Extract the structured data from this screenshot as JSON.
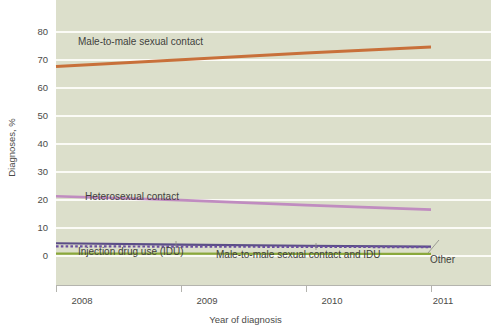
{
  "chart_data": {
    "type": "line",
    "title": "",
    "xlabel": "Year of diagnosis",
    "ylabel": "Diagnoses, %",
    "x": [
      2008,
      2009,
      2010,
      2011
    ],
    "xticklabels": [
      "2008",
      "2009",
      "2010",
      "2011"
    ],
    "xlim": [
      2008,
      2011
    ],
    "ylim": [
      0,
      80
    ],
    "yticks": [
      0,
      10,
      20,
      30,
      40,
      50,
      60,
      70,
      80
    ],
    "yticklabels": [
      "0",
      "10",
      "20",
      "30",
      "40",
      "50",
      "60",
      "70",
      "80"
    ],
    "grid": "horizontal",
    "legend": "inline-annotations",
    "series": [
      {
        "name": "Male-to-male sexual contact",
        "values": [
          67.3,
          69.7,
          72.1,
          74.3
        ],
        "color": "#c8703a",
        "style": "solid",
        "width": 3
      },
      {
        "name": "Heterosexual contact",
        "values": [
          21.0,
          19.6,
          17.8,
          16.2
        ],
        "color": "#c08cc0",
        "style": "solid",
        "width": 2.6
      },
      {
        "name": "Injection drug use (IDU)",
        "values": [
          4.2,
          3.7,
          3.3,
          3.0
        ],
        "color": "#5b4e86",
        "style": "solid",
        "width": 2.2
      },
      {
        "name": "Male-to-male sexual contact and IDU",
        "values": [
          3.1,
          3.0,
          2.9,
          2.8
        ],
        "color": "#6b4fa0",
        "style": "dotted",
        "width": 2.2
      },
      {
        "name": "Other",
        "values": [
          0.5,
          0.5,
          0.4,
          0.4
        ],
        "color": "#8aa83c",
        "style": "solid",
        "width": 2.4
      }
    ],
    "annotations": [
      {
        "text": "Male-to-male sexual contact",
        "for": "Male-to-male sexual contact"
      },
      {
        "text": "Heterosexual contact",
        "for": "Heterosexual contact"
      },
      {
        "text": "Injection drug use (IDU)",
        "for": "Injection drug use (IDU)"
      },
      {
        "text": "Male-to-male sexual contact and IDU",
        "for": "Male-to-male sexual contact and IDU"
      },
      {
        "text": "Other",
        "for": "Other"
      }
    ]
  },
  "axes": {
    "ytick_0": "0",
    "ytick_10": "10",
    "ytick_20": "20",
    "ytick_30": "30",
    "ytick_40": "40",
    "ytick_50": "50",
    "ytick_60": "60",
    "ytick_70": "70",
    "ytick_80": "80",
    "xtick_2008": "2008",
    "xtick_2009": "2009",
    "xtick_2010": "2010",
    "xtick_2011": "2011",
    "ylabel": "Diagnoses, %",
    "xlabel": "Year of diagnosis"
  },
  "labels": {
    "msm": "Male-to-male sexual contact",
    "heterosexual": "Heterosexual contact",
    "idu": "Injection drug use (IDU)",
    "msm_idu": "Male-to-male sexual contact and IDU",
    "other": "Other"
  },
  "colors": {
    "panel_background": "#dcdfcb",
    "gridline": "#fbfbf6",
    "page_background": "#ffffff",
    "axis": "#b4b4ae",
    "text": "#4b4b48",
    "msm": "#c8703a",
    "heterosexual": "#c08cc0",
    "idu": "#5b4e86",
    "msm_idu": "#6b4fa0",
    "other": "#8aa83c"
  }
}
